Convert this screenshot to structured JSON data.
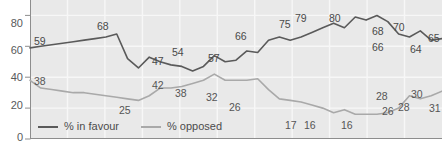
{
  "chart_data": {
    "type": "line",
    "title": "",
    "xlabel": "",
    "ylabel": "",
    "ylim": [
      0,
      90
    ],
    "yticks": [
      0,
      20,
      40,
      60,
      80
    ],
    "grid": true,
    "legend_position": "bottom-left",
    "x": [
      0,
      1,
      2,
      3,
      4,
      5,
      6,
      7,
      8,
      9,
      10,
      11,
      12,
      13,
      14,
      15,
      16,
      17,
      18,
      19,
      20,
      21,
      22,
      23,
      24,
      25,
      26,
      27,
      28,
      29,
      30,
      31,
      32,
      33,
      34,
      35,
      36,
      37,
      38
    ],
    "series": [
      {
        "name": "% in favour",
        "color": "#5a5a5a",
        "values": [
          59,
          60,
          61,
          62,
          63,
          64,
          65,
          66,
          68,
          52,
          46,
          53,
          50,
          48,
          47,
          44,
          47,
          54,
          50,
          51,
          57,
          56,
          64,
          66,
          64,
          66,
          69,
          72,
          75,
          72,
          79,
          77,
          80,
          76,
          68,
          66,
          70,
          64,
          65
        ]
      },
      {
        "name": "% opposed",
        "color": "#a9a9a9",
        "values": [
          38,
          33,
          32,
          31,
          30,
          30,
          29,
          28,
          27,
          26,
          25,
          28,
          33,
          33,
          34,
          36,
          38,
          42,
          38,
          38,
          38,
          39,
          32,
          26,
          25,
          24,
          22,
          20,
          17,
          19,
          16,
          16,
          16,
          17,
          20,
          28,
          26,
          28,
          31
        ]
      }
    ],
    "point_labels": [
      {
        "series": "% in favour",
        "value": "59",
        "x": 34,
        "y": 36
      },
      {
        "series": "% in favour",
        "value": "68",
        "x": 97,
        "y": 21
      },
      {
        "series": "% in favour",
        "value": "47",
        "x": 152,
        "y": 56
      },
      {
        "series": "% in favour",
        "value": "54",
        "x": 172,
        "y": 47
      },
      {
        "series": "% in favour",
        "value": "57",
        "x": 208,
        "y": 53
      },
      {
        "series": "% in favour",
        "value": "66",
        "x": 235,
        "y": 31
      },
      {
        "series": "% in favour",
        "value": "75",
        "x": 279,
        "y": 19
      },
      {
        "series": "% in favour",
        "value": "79",
        "x": 295,
        "y": 13
      },
      {
        "series": "% in favour",
        "value": "80",
        "x": 329,
        "y": 13
      },
      {
        "series": "% in favour",
        "value": "68",
        "x": 372,
        "y": 26
      },
      {
        "series": "% in favour",
        "value": "66",
        "x": 372,
        "y": 42
      },
      {
        "series": "% in favour",
        "value": "70",
        "x": 393,
        "y": 22
      },
      {
        "series": "% in favour",
        "value": "64",
        "x": 410,
        "y": 44
      },
      {
        "series": "% in favour",
        "value": "65",
        "x": 428,
        "y": 33
      },
      {
        "series": "% opposed",
        "value": "38",
        "x": 34,
        "y": 76
      },
      {
        "series": "% opposed",
        "value": "25",
        "x": 119,
        "y": 105
      },
      {
        "series": "% opposed",
        "value": "42",
        "x": 152,
        "y": 80
      },
      {
        "series": "% opposed",
        "value": "38",
        "x": 175,
        "y": 88
      },
      {
        "series": "% opposed",
        "value": "32",
        "x": 206,
        "y": 92
      },
      {
        "series": "% opposed",
        "value": "26",
        "x": 229,
        "y": 102
      },
      {
        "series": "% opposed",
        "value": "17",
        "x": 285,
        "y": 120
      },
      {
        "series": "% opposed",
        "value": "16",
        "x": 304,
        "y": 120
      },
      {
        "series": "% opposed",
        "value": "16",
        "x": 341,
        "y": 120
      },
      {
        "series": "% opposed",
        "value": "28",
        "x": 376,
        "y": 91
      },
      {
        "series": "% opposed",
        "value": "26",
        "x": 382,
        "y": 106
      },
      {
        "series": "% opposed",
        "value": "28",
        "x": 398,
        "y": 102
      },
      {
        "series": "% opposed",
        "value": "30",
        "x": 411,
        "y": 89
      },
      {
        "series": "% opposed",
        "value": "31",
        "x": 429,
        "y": 103
      }
    ]
  },
  "axis": {
    "y_tick_labels": [
      {
        "text": "80",
        "y": 18
      },
      {
        "text": "60",
        "y": 45
      },
      {
        "text": "40",
        "y": 72
      },
      {
        "text": "20",
        "y": 100
      },
      {
        "text": "0",
        "y": 132
      }
    ]
  },
  "legend": {
    "entries": [
      {
        "label": "% in favour",
        "color": "#5a5a5a"
      },
      {
        "label": "% opposed",
        "color": "#a9a9a9"
      }
    ]
  },
  "colors": {
    "plot_background": "#e9e9e9",
    "gridline": "#f7f7f7",
    "axis": "#8d8d8d",
    "favour_line": "#5a5a5a",
    "opposed_line": "#a9a9a9",
    "label_text": "#4a4a4a"
  }
}
